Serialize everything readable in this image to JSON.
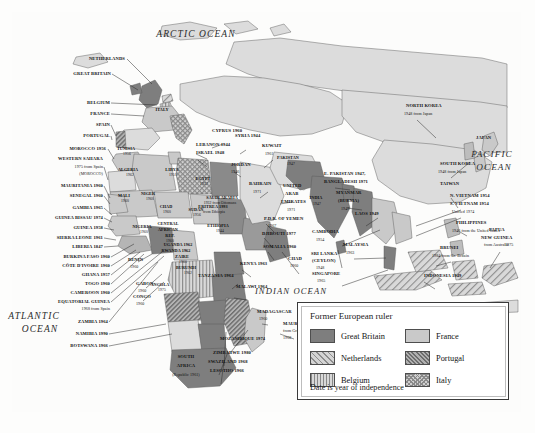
{
  "map": {
    "title": "Decolonization of Africa and Asia",
    "oceans": [
      {
        "name": "ARCTIC OCEAN",
        "x": 196,
        "y": 30,
        "size": 9.5
      },
      {
        "name": "ATLANTIC",
        "x": 34,
        "y": 312,
        "size": 9.5
      },
      {
        "name": "OCEAN",
        "x": 40,
        "y": 325,
        "size": 9.5
      },
      {
        "name": "INDIAN OCEAN",
        "x": 291,
        "y": 287,
        "size": 8.6
      },
      {
        "name": "PACIFIC",
        "x": 492,
        "y": 150,
        "size": 9.2
      },
      {
        "name": "OCEAN",
        "x": 494,
        "y": 163,
        "size": 9.2
      }
    ],
    "external_labels": [
      {
        "text": "NETHERLANDS",
        "x": 125,
        "y": 57,
        "align": "r"
      },
      {
        "text": "GREAT BRITAIN",
        "x": 111,
        "y": 72,
        "align": "r"
      },
      {
        "text": "BELGIUM",
        "x": 110,
        "y": 101,
        "align": "r"
      },
      {
        "text": "FRANCE",
        "x": 110,
        "y": 112,
        "align": "r"
      },
      {
        "text": "SPAIN",
        "x": 110,
        "y": 123,
        "align": "r"
      },
      {
        "text": "PORTUGAL",
        "x": 110,
        "y": 134,
        "align": "r"
      },
      {
        "text": "MOROCCO 1956",
        "x": 106,
        "y": 147,
        "align": "r"
      },
      {
        "text": "WESTERN SAHARA",
        "x": 103,
        "y": 157,
        "align": "r"
      },
      {
        "text": "1975 from Spain",
        "x": 103,
        "y": 165,
        "align": "r",
        "sub": true
      },
      {
        "text": "(MOROCCO)",
        "x": 103,
        "y": 172,
        "align": "r",
        "sub": true
      },
      {
        "text": "MAURITANIA 1960",
        "x": 103,
        "y": 184,
        "align": "r"
      },
      {
        "text": "SENEGAL 1960",
        "x": 103,
        "y": 194,
        "align": "r"
      },
      {
        "text": "GAMBIA 1965",
        "x": 103,
        "y": 206,
        "align": "r"
      },
      {
        "text": "GUINEA BISSAU 1974",
        "x": 103,
        "y": 216,
        "align": "r"
      },
      {
        "text": "GUINEA 1958",
        "x": 103,
        "y": 226,
        "align": "r"
      },
      {
        "text": "SIERRA LEONE 1961",
        "x": 103,
        "y": 236,
        "align": "r"
      },
      {
        "text": "LIBERIA 1847",
        "x": 103,
        "y": 245,
        "align": "r"
      },
      {
        "text": "BURKINA FASO 1960",
        "x": 110,
        "y": 255,
        "align": "r"
      },
      {
        "text": "CÔTE D'IVOIRE 1960",
        "x": 110,
        "y": 264,
        "align": "r"
      },
      {
        "text": "GHANA 1957",
        "x": 110,
        "y": 273,
        "align": "r"
      },
      {
        "text": "TOGO 1960",
        "x": 110,
        "y": 282,
        "align": "r"
      },
      {
        "text": "CAMEROON 1960",
        "x": 110,
        "y": 291,
        "align": "r"
      },
      {
        "text": "EQUATORIAL GUINEA",
        "x": 110,
        "y": 300,
        "align": "r"
      },
      {
        "text": "1968 from Spain",
        "x": 110,
        "y": 307,
        "align": "r",
        "sub": true
      },
      {
        "text": "ZAMBIA 1964",
        "x": 108,
        "y": 320,
        "align": "r"
      },
      {
        "text": "NAMIBIA 1990",
        "x": 108,
        "y": 332,
        "align": "r"
      },
      {
        "text": "BOTSWANA 1966",
        "x": 108,
        "y": 344,
        "align": "r"
      },
      {
        "text": "BENIN",
        "x": 128,
        "y": 258,
        "align": "l"
      },
      {
        "text": "1960",
        "x": 130,
        "y": 265,
        "align": "l",
        "sub": true
      },
      {
        "text": "GABON",
        "x": 136,
        "y": 282,
        "align": "l"
      },
      {
        "text": "1960",
        "x": 138,
        "y": 289,
        "align": "l",
        "sub": true
      },
      {
        "text": "CONGO",
        "x": 133,
        "y": 295,
        "align": "l"
      },
      {
        "text": "1960",
        "x": 136,
        "y": 302,
        "align": "l",
        "sub": true
      },
      {
        "text": "LEBANON 1944",
        "x": 196,
        "y": 143,
        "align": "l"
      },
      {
        "text": "ISRAEL 1948",
        "x": 196,
        "y": 151,
        "align": "l"
      },
      {
        "text": "JORDAN",
        "x": 231,
        "y": 163,
        "align": "l"
      },
      {
        "text": "1946",
        "x": 231,
        "y": 170,
        "align": "l",
        "sub": true
      },
      {
        "text": "SYRIA 1944",
        "x": 235,
        "y": 134,
        "align": "l"
      },
      {
        "text": "CYPRUS 1960",
        "x": 212,
        "y": 129,
        "align": "l"
      },
      {
        "text": "KUWAIT",
        "x": 262,
        "y": 144,
        "align": "l"
      },
      {
        "text": "1961",
        "x": 265,
        "y": 152,
        "align": "l",
        "sub": true
      },
      {
        "text": "BAHRAIN",
        "x": 249,
        "y": 182,
        "align": "l"
      },
      {
        "text": "1971",
        "x": 253,
        "y": 190,
        "align": "l",
        "sub": true
      },
      {
        "text": "UNITED",
        "x": 283,
        "y": 184,
        "align": "l"
      },
      {
        "text": "ARAB",
        "x": 285,
        "y": 192,
        "align": "l"
      },
      {
        "text": "EMIRATES",
        "x": 281,
        "y": 200,
        "align": "l"
      },
      {
        "text": "1971",
        "x": 287,
        "y": 208,
        "align": "l",
        "sub": true
      },
      {
        "text": "P.D.R. OF YEMEN",
        "x": 264,
        "y": 217,
        "align": "l"
      },
      {
        "text": "1967",
        "x": 268,
        "y": 224,
        "align": "l",
        "sub": true
      },
      {
        "text": "DJIBOUTI 1977",
        "x": 262,
        "y": 232,
        "align": "l"
      },
      {
        "text": "SOMALIA 1960",
        "x": 263,
        "y": 245,
        "align": "l"
      },
      {
        "text": "CHAD",
        "x": 288,
        "y": 257,
        "align": "l"
      },
      {
        "text": "1960",
        "x": 290,
        "y": 264,
        "align": "l",
        "sub": true
      },
      {
        "text": "KENYA 1963",
        "x": 240,
        "y": 262,
        "align": "l"
      },
      {
        "text": "TANZANIA 1964",
        "x": 198,
        "y": 274,
        "align": "l"
      },
      {
        "text": "MALAWI 1964",
        "x": 236,
        "y": 285,
        "align": "l"
      },
      {
        "text": "MADAGASCAR",
        "x": 257,
        "y": 310,
        "align": "l"
      },
      {
        "text": "1960",
        "x": 259,
        "y": 317,
        "align": "l",
        "sub": true
      },
      {
        "text": "MAURITIUS",
        "x": 283,
        "y": 322,
        "align": "l"
      },
      {
        "text": "from Great Britain",
        "x": 283,
        "y": 329,
        "align": "l",
        "sub": true
      },
      {
        "text": "1968",
        "x": 283,
        "y": 336,
        "align": "l",
        "sub": true
      },
      {
        "text": "MOZAMBIQUE 1974",
        "x": 220,
        "y": 337,
        "align": "l"
      },
      {
        "text": "ZIMBABWE 1980",
        "x": 213,
        "y": 351,
        "align": "l"
      },
      {
        "text": "SWAZILAND 1968",
        "x": 208,
        "y": 360,
        "align": "l"
      },
      {
        "text": "LESOTHO 1966",
        "x": 210,
        "y": 369,
        "align": "l"
      },
      {
        "text": "E. PAKISTAN 1947,",
        "x": 324,
        "y": 172,
        "align": "l"
      },
      {
        "text": "BANGLADESH 1971",
        "x": 324,
        "y": 180,
        "align": "l"
      },
      {
        "text": "MYANMAR",
        "x": 336,
        "y": 191,
        "align": "l"
      },
      {
        "text": "(BURMA)",
        "x": 338,
        "y": 199,
        "align": "l"
      },
      {
        "text": "1947",
        "x": 341,
        "y": 207,
        "align": "l",
        "sub": true
      },
      {
        "text": "LAOS 1949",
        "x": 355,
        "y": 212,
        "align": "l"
      },
      {
        "text": "CAMBODIA",
        "x": 312,
        "y": 230,
        "align": "l"
      },
      {
        "text": "1954",
        "x": 316,
        "y": 238,
        "align": "l",
        "sub": true
      },
      {
        "text": "SRI LANKA",
        "x": 311,
        "y": 252,
        "align": "l"
      },
      {
        "text": "(CEYLON)",
        "x": 312,
        "y": 259,
        "align": "l"
      },
      {
        "text": "1948",
        "x": 316,
        "y": 266,
        "align": "l",
        "sub": true
      },
      {
        "text": "MALAYSIA",
        "x": 343,
        "y": 243,
        "align": "l"
      },
      {
        "text": "1963",
        "x": 346,
        "y": 251,
        "align": "l",
        "sub": true
      },
      {
        "text": "SINGAPORE",
        "x": 312,
        "y": 272,
        "align": "l"
      },
      {
        "text": "1965",
        "x": 317,
        "y": 279,
        "align": "l",
        "sub": true
      },
      {
        "text": "NORTH KOREA",
        "x": 406,
        "y": 104,
        "align": "l"
      },
      {
        "text": "1948 from Japan",
        "x": 404,
        "y": 112,
        "align": "l",
        "sub": true
      },
      {
        "text": "JAPAN",
        "x": 476,
        "y": 136,
        "align": "l"
      },
      {
        "text": "SOUTH KOREA",
        "x": 440,
        "y": 162,
        "align": "l"
      },
      {
        "text": "1948 from Japan",
        "x": 438,
        "y": 170,
        "align": "l",
        "sub": true
      },
      {
        "text": "TAIWAN",
        "x": 440,
        "y": 182,
        "align": "l"
      },
      {
        "text": "N. VIETNAM 1954",
        "x": 450,
        "y": 194,
        "align": "l"
      },
      {
        "text": "S. VIETNAM 1954",
        "x": 450,
        "y": 202,
        "align": "l"
      },
      {
        "text": "Unified 1974",
        "x": 452,
        "y": 210,
        "align": "l",
        "sub": true
      },
      {
        "text": "PHILIPPINES",
        "x": 456,
        "y": 221,
        "align": "l"
      },
      {
        "text": "1946 from the United States",
        "x": 452,
        "y": 229,
        "align": "l",
        "sub": true
      },
      {
        "text": "PAPUA",
        "x": 489,
        "y": 228,
        "align": "l"
      },
      {
        "text": "NEW GUINEA",
        "x": 481,
        "y": 236,
        "align": "l"
      },
      {
        "text": "from Australia",
        "x": 484,
        "y": 243,
        "align": "l",
        "sub": true
      },
      {
        "text": "1975",
        "x": 505,
        "y": 243,
        "align": "l",
        "sub": true
      },
      {
        "text": "BRUNEI",
        "x": 440,
        "y": 246,
        "align": "l"
      },
      {
        "text": "1984 from Gr. Britain",
        "x": 432,
        "y": 254,
        "align": "l",
        "sub": true
      },
      {
        "text": "INDONESIA 1949",
        "x": 424,
        "y": 274,
        "align": "l"
      },
      {
        "text": "SOUTH",
        "x": 186,
        "y": 355,
        "align": "c"
      },
      {
        "text": "AFRICA",
        "x": 186,
        "y": 364,
        "align": "c"
      },
      {
        "text": "(Republic 1961)",
        "x": 186,
        "y": 373,
        "align": "c",
        "sub": true
      }
    ],
    "inmap_labels": [
      {
        "text": "ITALY",
        "x": 162,
        "y": 108
      },
      {
        "text": "TUNISIA",
        "x": 126,
        "y": 147
      },
      {
        "text": "1956",
        "x": 127,
        "y": 153,
        "sub": true
      },
      {
        "text": "ALGERIA",
        "x": 128,
        "y": 168
      },
      {
        "text": "1962",
        "x": 130,
        "y": 174,
        "sub": true
      },
      {
        "text": "LIBYA",
        "x": 172,
        "y": 168
      },
      {
        "text": "1951",
        "x": 173,
        "y": 174,
        "sub": true
      },
      {
        "text": "EGYPT",
        "x": 203,
        "y": 177
      },
      {
        "text": "1922",
        "x": 204,
        "y": 183,
        "sub": true
      },
      {
        "text": "SAUDI ARABIA",
        "x": 222,
        "y": 196
      },
      {
        "text": "1932 from Ottomans",
        "x": 220,
        "y": 202,
        "sub": true
      },
      {
        "text": "MALI",
        "x": 124,
        "y": 194
      },
      {
        "text": "1960",
        "x": 125,
        "y": 200,
        "sub": true
      },
      {
        "text": "NIGER",
        "x": 148,
        "y": 192
      },
      {
        "text": "1960",
        "x": 150,
        "y": 198,
        "sub": true
      },
      {
        "text": "NIGERIA",
        "x": 142,
        "y": 225
      },
      {
        "text": "1960",
        "x": 144,
        "y": 231,
        "sub": true
      },
      {
        "text": "CHAD",
        "x": 166,
        "y": 205
      },
      {
        "text": "1960",
        "x": 167,
        "y": 211,
        "sub": true
      },
      {
        "text": "SUDAN",
        "x": 196,
        "y": 208
      },
      {
        "text": "1956",
        "x": 197,
        "y": 214,
        "sub": true
      },
      {
        "text": "ETHIOPIA",
        "x": 218,
        "y": 224
      },
      {
        "text": "1944",
        "x": 220,
        "y": 230,
        "sub": true
      },
      {
        "text": "CENTRAL",
        "x": 168,
        "y": 222
      },
      {
        "text": "AFRICAN",
        "x": 168,
        "y": 228
      },
      {
        "text": "REP.",
        "x": 170,
        "y": 234
      },
      {
        "text": "1960",
        "x": 170,
        "y": 240,
        "sub": true
      },
      {
        "text": "UGANDA 1962",
        "x": 178,
        "y": 243
      },
      {
        "text": "RWANDA 1962",
        "x": 176,
        "y": 249
      },
      {
        "text": "ZAIRE",
        "x": 182,
        "y": 255
      },
      {
        "text": "1960",
        "x": 183,
        "y": 261,
        "sub": true
      },
      {
        "text": "BURUNDI",
        "x": 186,
        "y": 266
      },
      {
        "text": "1962",
        "x": 188,
        "y": 272,
        "sub": true
      },
      {
        "text": "ANGOLA",
        "x": 160,
        "y": 283
      },
      {
        "text": "1975",
        "x": 162,
        "y": 289,
        "sub": true
      },
      {
        "text": "PAKISTAN",
        "x": 288,
        "y": 156
      },
      {
        "text": "1947",
        "x": 291,
        "y": 163,
        "sub": true
      },
      {
        "text": "INDIA",
        "x": 316,
        "y": 196
      },
      {
        "text": "1947",
        "x": 317,
        "y": 203,
        "sub": true
      },
      {
        "text": "ERITREA 1993",
        "x": 213,
        "y": 205
      },
      {
        "text": "from Ethiopia",
        "x": 214,
        "y": 211,
        "sub": true
      }
    ],
    "legend": {
      "title": "Former European ruler",
      "footnote": "Date is year of independence",
      "entries": [
        {
          "label": "Great Britain",
          "pattern": "sw-gb"
        },
        {
          "label": "France",
          "pattern": "sw-fr"
        },
        {
          "label": "Netherlands",
          "pattern": "sw-nl"
        },
        {
          "label": "Portugal",
          "pattern": "sw-pt"
        },
        {
          "label": "Belgium",
          "pattern": "sw-be"
        },
        {
          "label": "Italy",
          "pattern": "sw-it"
        }
      ]
    },
    "colors": {
      "great_britain": "#7e7e7e",
      "france": "#c9c9c9",
      "netherlands": "#d4d4d4",
      "portugal": "#b0b0b0",
      "belgium": "#d8d8d8",
      "italy": "#cfcfcf",
      "land_other": "#dcdcdc",
      "ocean": "#ffffff",
      "frame": "#4a4a4a"
    }
  }
}
